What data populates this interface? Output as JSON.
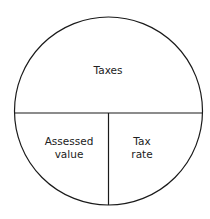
{
  "diagram": {
    "top_label": "Taxes",
    "bottom_left_label_line1": "Assessed",
    "bottom_left_label_line2": "value",
    "bottom_right_label_line1": "Tax",
    "bottom_right_label_line2": "rate",
    "stroke_color": "#1a1a1a"
  }
}
